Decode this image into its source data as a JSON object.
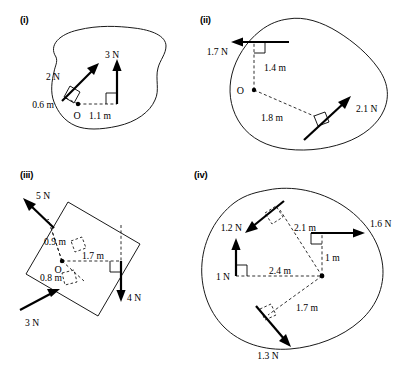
{
  "figures": [
    {
      "id": "fig-i",
      "label": "(i)",
      "body_shape": "irregular-blob",
      "origin_label": "O",
      "forces": [
        {
          "name": "force-2n",
          "magnitude": "2 N",
          "direction": "up-right",
          "perpendicular_distance": "0.6 m"
        },
        {
          "name": "force-3n",
          "magnitude": "3 N",
          "direction": "up",
          "perpendicular_distance": "1.1 m"
        }
      ],
      "distances": [
        "0.6 m",
        "1.1 m"
      ]
    },
    {
      "id": "fig-ii",
      "label": "(ii)",
      "body_shape": "irregular-blob",
      "origin_label": "O",
      "forces": [
        {
          "name": "force-1p7n",
          "magnitude": "1.7 N",
          "direction": "left",
          "perpendicular_distance": "1.4 m"
        },
        {
          "name": "force-2p1n",
          "magnitude": "2.1 N",
          "direction": "up-right",
          "perpendicular_distance": "1.8 m"
        }
      ],
      "distances": [
        "1.4 m",
        "1.8 m"
      ]
    },
    {
      "id": "fig-iii",
      "label": "(iii)",
      "body_shape": "rotated-square-plate",
      "origin_label": "O",
      "forces": [
        {
          "name": "force-5n",
          "magnitude": "5 N",
          "direction": "up-left",
          "perpendicular_distance": "0.9 m"
        },
        {
          "name": "force-3n",
          "magnitude": "3 N",
          "direction": "up-right",
          "perpendicular_distance": "0.8 m"
        },
        {
          "name": "force-4n",
          "magnitude": "4 N",
          "direction": "down",
          "perpendicular_distance": "1.7 m"
        }
      ],
      "distances": [
        "0.9 m",
        "1.7 m",
        "0.8 m"
      ]
    },
    {
      "id": "fig-iv",
      "label": "(iv)",
      "body_shape": "irregular-blob",
      "origin_label": "",
      "forces": [
        {
          "name": "force-1p2n",
          "magnitude": "1.2 N",
          "direction": "down-left",
          "perpendicular_distance": "2.1 m"
        },
        {
          "name": "force-1p6n",
          "magnitude": "1.6 N",
          "direction": "right",
          "perpendicular_distance": "1 m"
        },
        {
          "name": "force-1n",
          "magnitude": "1 N",
          "direction": "up",
          "perpendicular_distance": "2.4 m"
        },
        {
          "name": "force-1p3n",
          "magnitude": "1.3 N",
          "direction": "down-right",
          "perpendicular_distance": "1.7 m"
        }
      ],
      "distances": [
        "2.1 m",
        "1 m",
        "2.4 m",
        "1.7 m"
      ]
    }
  ],
  "colors": {
    "ink": "#000000",
    "outline": "#1a1a1a",
    "background": "#ffffff"
  }
}
